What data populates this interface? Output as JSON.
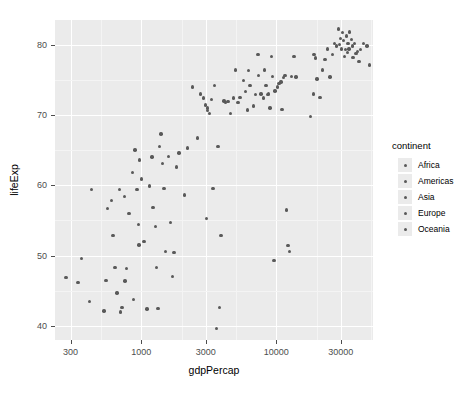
{
  "chart_data": {
    "type": "scatter",
    "title": "",
    "xlabel": "gdpPercap",
    "ylabel": "lifeExp",
    "xscale": "log10",
    "xlim": [
      230,
      52000
    ],
    "ylim": [
      38.0,
      83.5
    ],
    "x_ticks": [
      300,
      1000,
      3000,
      10000,
      30000
    ],
    "x_tick_labels": [
      "300",
      "1000",
      "3000",
      "10000",
      "30000"
    ],
    "y_ticks": [
      40,
      50,
      60,
      70,
      80
    ],
    "y_tick_labels": [
      "40",
      "50",
      "60",
      "70",
      "80"
    ],
    "grid": true,
    "legend_position": "right",
    "legend": {
      "title": "continent",
      "entries": [
        "Africa",
        "Americas",
        "Asia",
        "Europe",
        "Oceania"
      ]
    },
    "point_color": "#595959",
    "panel_background": "#ebebeb",
    "grid_color": "#ffffff",
    "points": [
      {
        "x": 278,
        "y": 46.9,
        "continent": "Africa"
      },
      {
        "x": 340,
        "y": 46.2,
        "continent": "Africa"
      },
      {
        "x": 363,
        "y": 49.6,
        "continent": "Africa"
      },
      {
        "x": 415,
        "y": 43.5,
        "continent": "Africa"
      },
      {
        "x": 430,
        "y": 59.4,
        "continent": "Asia"
      },
      {
        "x": 530,
        "y": 42.1,
        "continent": "Africa"
      },
      {
        "x": 550,
        "y": 46.5,
        "continent": "Africa"
      },
      {
        "x": 560,
        "y": 56.7,
        "continent": "Africa"
      },
      {
        "x": 600,
        "y": 57.8,
        "continent": "Asia"
      },
      {
        "x": 620,
        "y": 52.9,
        "continent": "Africa"
      },
      {
        "x": 640,
        "y": 48.3,
        "continent": "Africa"
      },
      {
        "x": 660,
        "y": 44.7,
        "continent": "Africa"
      },
      {
        "x": 690,
        "y": 59.4,
        "continent": "Asia"
      },
      {
        "x": 706,
        "y": 42.0,
        "continent": "Africa"
      },
      {
        "x": 720,
        "y": 42.6,
        "continent": "Africa"
      },
      {
        "x": 750,
        "y": 58.4,
        "continent": "Africa"
      },
      {
        "x": 760,
        "y": 46.4,
        "continent": "Africa"
      },
      {
        "x": 780,
        "y": 48.2,
        "continent": "Africa"
      },
      {
        "x": 810,
        "y": 56.0,
        "continent": "Africa"
      },
      {
        "x": 860,
        "y": 61.8,
        "continent": "Asia"
      },
      {
        "x": 880,
        "y": 43.8,
        "continent": "Africa"
      },
      {
        "x": 900,
        "y": 65.0,
        "continent": "Asia"
      },
      {
        "x": 930,
        "y": 59.4,
        "continent": "Africa"
      },
      {
        "x": 950,
        "y": 54.4,
        "continent": "Africa"
      },
      {
        "x": 960,
        "y": 51.5,
        "continent": "Africa"
      },
      {
        "x": 975,
        "y": 63.6,
        "continent": "Asia"
      },
      {
        "x": 1000,
        "y": 60.9,
        "continent": "Asia"
      },
      {
        "x": 1050,
        "y": 52.0,
        "continent": "Africa"
      },
      {
        "x": 1100,
        "y": 42.4,
        "continent": "Africa"
      },
      {
        "x": 1150,
        "y": 59.9,
        "continent": "Asia"
      },
      {
        "x": 1200,
        "y": 64.0,
        "continent": "Asia"
      },
      {
        "x": 1220,
        "y": 56.8,
        "continent": "Africa"
      },
      {
        "x": 1270,
        "y": 54.1,
        "continent": "Africa"
      },
      {
        "x": 1300,
        "y": 48.3,
        "continent": "Africa"
      },
      {
        "x": 1330,
        "y": 42.5,
        "continent": "Africa"
      },
      {
        "x": 1360,
        "y": 65.5,
        "continent": "Asia"
      },
      {
        "x": 1400,
        "y": 67.3,
        "continent": "Asia"
      },
      {
        "x": 1440,
        "y": 63.1,
        "continent": "Asia"
      },
      {
        "x": 1470,
        "y": 59.5,
        "continent": "Asia"
      },
      {
        "x": 1520,
        "y": 50.6,
        "continent": "Africa"
      },
      {
        "x": 1600,
        "y": 64.1,
        "continent": "Asia"
      },
      {
        "x": 1640,
        "y": 54.7,
        "continent": "Africa"
      },
      {
        "x": 1700,
        "y": 47.0,
        "continent": "Africa"
      },
      {
        "x": 1750,
        "y": 50.4,
        "continent": "Africa"
      },
      {
        "x": 1820,
        "y": 62.6,
        "continent": "Asia"
      },
      {
        "x": 1900,
        "y": 64.6,
        "continent": "Asia"
      },
      {
        "x": 2100,
        "y": 58.6,
        "continent": "Africa"
      },
      {
        "x": 2200,
        "y": 65.3,
        "continent": "Asia"
      },
      {
        "x": 2400,
        "y": 74.0,
        "continent": "Americas"
      },
      {
        "x": 2600,
        "y": 66.7,
        "continent": "Asia"
      },
      {
        "x": 2750,
        "y": 73.0,
        "continent": "Americas"
      },
      {
        "x": 2900,
        "y": 72.4,
        "continent": "Asia"
      },
      {
        "x": 3000,
        "y": 71.4,
        "continent": "Asia"
      },
      {
        "x": 3050,
        "y": 55.3,
        "continent": "Africa"
      },
      {
        "x": 3080,
        "y": 70.6,
        "continent": "Asia"
      },
      {
        "x": 3100,
        "y": 71.0,
        "continent": "Asia"
      },
      {
        "x": 3200,
        "y": 70.2,
        "continent": "Americas"
      },
      {
        "x": 3300,
        "y": 72.2,
        "continent": "Americas"
      },
      {
        "x": 3400,
        "y": 59.5,
        "continent": "Africa"
      },
      {
        "x": 3500,
        "y": 74.2,
        "continent": "Americas"
      },
      {
        "x": 3600,
        "y": 39.6,
        "continent": "Africa"
      },
      {
        "x": 3700,
        "y": 65.5,
        "continent": "Asia"
      },
      {
        "x": 3800,
        "y": 42.6,
        "continent": "Africa"
      },
      {
        "x": 3900,
        "y": 52.9,
        "continent": "Africa"
      },
      {
        "x": 4100,
        "y": 72.0,
        "continent": "Americas"
      },
      {
        "x": 4200,
        "y": 71.8,
        "continent": "Americas"
      },
      {
        "x": 4400,
        "y": 71.9,
        "continent": "Asia"
      },
      {
        "x": 4600,
        "y": 70.2,
        "continent": "Americas"
      },
      {
        "x": 4800,
        "y": 72.4,
        "continent": "Americas"
      },
      {
        "x": 5000,
        "y": 76.4,
        "continent": "Americas"
      },
      {
        "x": 5200,
        "y": 71.8,
        "continent": "Asia"
      },
      {
        "x": 5400,
        "y": 72.5,
        "continent": "Americas"
      },
      {
        "x": 5700,
        "y": 74.9,
        "continent": "Americas"
      },
      {
        "x": 5900,
        "y": 73.3,
        "continent": "Americas"
      },
      {
        "x": 6100,
        "y": 70.7,
        "continent": "Americas"
      },
      {
        "x": 6250,
        "y": 76.3,
        "continent": "Americas"
      },
      {
        "x": 6400,
        "y": 74.2,
        "continent": "Asia"
      },
      {
        "x": 6800,
        "y": 71.3,
        "continent": "Americas"
      },
      {
        "x": 7000,
        "y": 72.9,
        "continent": "Americas"
      },
      {
        "x": 7300,
        "y": 78.6,
        "continent": "Americas"
      },
      {
        "x": 7400,
        "y": 75.6,
        "continent": "Americas"
      },
      {
        "x": 7700,
        "y": 73.0,
        "continent": "Americas"
      },
      {
        "x": 8000,
        "y": 72.4,
        "continent": "Asia"
      },
      {
        "x": 8200,
        "y": 76.4,
        "continent": "Europe"
      },
      {
        "x": 8400,
        "y": 74.2,
        "continent": "Americas"
      },
      {
        "x": 8600,
        "y": 72.9,
        "continent": "Europe"
      },
      {
        "x": 8800,
        "y": 73.0,
        "continent": "Europe"
      },
      {
        "x": 9000,
        "y": 71.0,
        "continent": "Asia"
      },
      {
        "x": 9200,
        "y": 78.3,
        "continent": "Americas"
      },
      {
        "x": 9400,
        "y": 75.5,
        "continent": "Europe"
      },
      {
        "x": 9600,
        "y": 49.3,
        "continent": "Africa"
      },
      {
        "x": 9800,
        "y": 73.4,
        "continent": "Europe"
      },
      {
        "x": 10200,
        "y": 74.0,
        "continent": "Europe"
      },
      {
        "x": 10500,
        "y": 74.5,
        "continent": "Europe"
      },
      {
        "x": 10800,
        "y": 74.7,
        "continent": "Europe"
      },
      {
        "x": 11000,
        "y": 70.8,
        "continent": "Europe"
      },
      {
        "x": 11300,
        "y": 75.3,
        "continent": "Europe"
      },
      {
        "x": 11600,
        "y": 75.6,
        "continent": "Europe"
      },
      {
        "x": 11900,
        "y": 56.5,
        "continent": "Africa"
      },
      {
        "x": 12200,
        "y": 51.4,
        "continent": "Africa"
      },
      {
        "x": 12500,
        "y": 50.6,
        "continent": "Africa"
      },
      {
        "x": 13000,
        "y": 75.5,
        "continent": "Europe"
      },
      {
        "x": 13500,
        "y": 78.3,
        "continent": "Americas"
      },
      {
        "x": 14000,
        "y": 75.4,
        "continent": "Europe"
      },
      {
        "x": 18000,
        "y": 69.8,
        "continent": "Asia"
      },
      {
        "x": 18800,
        "y": 73.0,
        "continent": "Americas"
      },
      {
        "x": 19000,
        "y": 78.6,
        "continent": "Europe"
      },
      {
        "x": 19500,
        "y": 78.1,
        "continent": "Europe"
      },
      {
        "x": 20000,
        "y": 75.1,
        "continent": "Europe"
      },
      {
        "x": 21000,
        "y": 72.5,
        "continent": "Europe"
      },
      {
        "x": 22000,
        "y": 76.4,
        "continent": "Europe"
      },
      {
        "x": 23000,
        "y": 77.9,
        "continent": "Europe"
      },
      {
        "x": 24000,
        "y": 79.4,
        "continent": "Europe"
      },
      {
        "x": 25000,
        "y": 75.4,
        "continent": "Asia"
      },
      {
        "x": 26000,
        "y": 78.6,
        "continent": "Europe"
      },
      {
        "x": 27000,
        "y": 80.2,
        "continent": "Europe"
      },
      {
        "x": 28000,
        "y": 79.8,
        "continent": "Europe"
      },
      {
        "x": 29000,
        "y": 82.2,
        "continent": "Asia"
      },
      {
        "x": 29500,
        "y": 80.0,
        "continent": "Europe"
      },
      {
        "x": 30000,
        "y": 80.9,
        "continent": "Europe"
      },
      {
        "x": 30500,
        "y": 79.4,
        "continent": "Europe"
      },
      {
        "x": 31000,
        "y": 81.7,
        "continent": "Europe"
      },
      {
        "x": 31500,
        "y": 80.6,
        "continent": "Oceania"
      },
      {
        "x": 32000,
        "y": 78.3,
        "continent": "Europe"
      },
      {
        "x": 32500,
        "y": 79.3,
        "continent": "Europe"
      },
      {
        "x": 33000,
        "y": 81.2,
        "continent": "Europe"
      },
      {
        "x": 33500,
        "y": 78.9,
        "continent": "Europe"
      },
      {
        "x": 34000,
        "y": 80.2,
        "continent": "Oceania"
      },
      {
        "x": 34500,
        "y": 79.4,
        "continent": "Europe"
      },
      {
        "x": 35000,
        "y": 81.8,
        "continent": "Europe"
      },
      {
        "x": 36000,
        "y": 80.7,
        "continent": "Europe"
      },
      {
        "x": 36500,
        "y": 79.8,
        "continent": "Europe"
      },
      {
        "x": 37000,
        "y": 78.2,
        "continent": "Europe"
      },
      {
        "x": 38000,
        "y": 80.2,
        "continent": "Europe"
      },
      {
        "x": 39000,
        "y": 78.7,
        "continent": "Americas"
      },
      {
        "x": 40000,
        "y": 79.0,
        "continent": "Europe"
      },
      {
        "x": 41000,
        "y": 77.6,
        "continent": "Europe"
      },
      {
        "x": 42000,
        "y": 79.3,
        "continent": "Europe"
      },
      {
        "x": 44000,
        "y": 80.2,
        "continent": "Europe"
      },
      {
        "x": 47000,
        "y": 79.8,
        "continent": "Europe"
      },
      {
        "x": 49000,
        "y": 77.1,
        "continent": "Europe"
      }
    ]
  }
}
